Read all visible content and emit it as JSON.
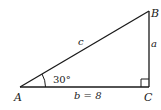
{
  "diagram": {
    "type": "right-triangle",
    "vertices": {
      "A": {
        "label": "A"
      },
      "B": {
        "label": "B"
      },
      "C": {
        "label": "C"
      }
    },
    "sides": {
      "a": {
        "label": "a"
      },
      "b": {
        "label": "b = 8"
      },
      "c": {
        "label": "c"
      }
    },
    "angle_A": {
      "label": "30°"
    },
    "right_angle_at": "C",
    "colors": {
      "stroke": "#1a1a1a",
      "background": "#ffffff"
    }
  }
}
